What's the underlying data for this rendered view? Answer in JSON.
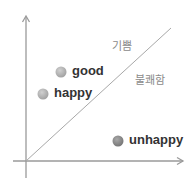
{
  "diagram": {
    "axes": {
      "color": "#9a9a9a",
      "x_arrow": true,
      "y_arrow": true
    },
    "divider": {
      "color": "#a8a8a8",
      "description": "diagonal line from origin to upper right"
    },
    "regions": {
      "upper": {
        "label": "기쁨"
      },
      "lower": {
        "label": "불쾌함"
      }
    },
    "points": [
      {
        "label": "good",
        "color": "#b0b0b0"
      },
      {
        "label": "happy",
        "color": "#b0b0b0"
      },
      {
        "label": "unhappy",
        "color": "#858585"
      }
    ]
  }
}
